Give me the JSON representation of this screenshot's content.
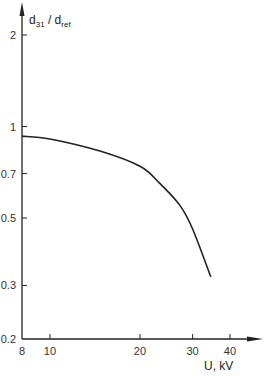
{
  "chart_data": {
    "type": "line",
    "title": "",
    "xlabel": "U, kV",
    "ylabel": "d31 / dref",
    "ylabel_parts": {
      "main1": "d",
      "sub1": "31",
      "sep": " / ",
      "main2": "d",
      "sub2": "ref"
    },
    "x_scale": "log",
    "y_scale": "log",
    "xlim": [
      8,
      45
    ],
    "ylim": [
      0.2,
      2.3
    ],
    "x_ticks": [
      8,
      10,
      20,
      30,
      40
    ],
    "x_tick_labels": [
      "8",
      "10",
      "20",
      "30",
      "40"
    ],
    "y_ticks": [
      0.2,
      0.3,
      0.5,
      0.7,
      1,
      2
    ],
    "y_tick_labels": [
      "0.2",
      "0.3",
      "0.5",
      "0.7",
      "1",
      "2"
    ],
    "grid": false,
    "legend": null,
    "series": [
      {
        "name": "d31/dref vs U",
        "x": [
          8,
          10,
          14.7,
          20,
          23.3,
          27.2,
          30,
          34.5
        ],
        "y": [
          0.93,
          0.91,
          0.83,
          0.74,
          0.65,
          0.55,
          0.46,
          0.32
        ]
      }
    ]
  }
}
